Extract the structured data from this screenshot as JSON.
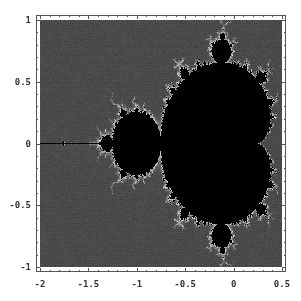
{
  "chart_data": {
    "type": "heatmap",
    "title": "",
    "subtitle": "",
    "xlabel": "",
    "ylabel": "",
    "xlim": [
      -2,
      0.5
    ],
    "ylim": [
      -1,
      1
    ],
    "grid": false,
    "legend": null,
    "x_ticks": [
      {
        "value": -2,
        "label": "-2"
      },
      {
        "value": -1.5,
        "label": "-1.5"
      },
      {
        "value": -1,
        "label": "-1"
      },
      {
        "value": -0.5,
        "label": "-0.5"
      },
      {
        "value": 0,
        "label": "0"
      },
      {
        "value": 0.5,
        "label": "0.5"
      }
    ],
    "y_ticks": [
      {
        "value": 1,
        "label": "1"
      },
      {
        "value": 0.5,
        "label": "0.5"
      },
      {
        "value": 0,
        "label": "0"
      },
      {
        "value": -0.5,
        "label": "-0.5"
      },
      {
        "value": -1,
        "label": "-1"
      }
    ],
    "minor_ticks_per_major": 5,
    "max_iterations": 60,
    "colors": {
      "interior": "#000000",
      "exterior": "#4a4a4a",
      "boundary": "#d8d8d8"
    }
  }
}
